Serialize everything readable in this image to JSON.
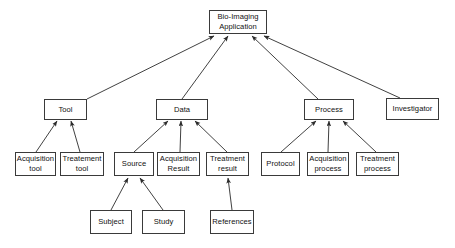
{
  "diagram": {
    "background_color": "#ffffff",
    "box_border_color": "#3a3a3a",
    "edge_color": "#2b2b2b",
    "text_color": "#111111",
    "nodes": [
      {
        "id": "app",
        "line1": "Bio-Imaging",
        "line2": "Application",
        "x": 209,
        "y": 10,
        "w": 58,
        "h": 24,
        "level": 0
      },
      {
        "id": "tool",
        "line1": "Tool",
        "line2": "",
        "x": 44,
        "y": 99,
        "w": 43,
        "h": 21,
        "level": 1
      },
      {
        "id": "data",
        "line1": "Data",
        "line2": "",
        "x": 156,
        "y": 99,
        "w": 52,
        "h": 21,
        "level": 1
      },
      {
        "id": "process",
        "line1": "Process",
        "line2": "",
        "x": 304,
        "y": 99,
        "w": 50,
        "h": 21,
        "level": 1
      },
      {
        "id": "investigator",
        "line1": "Investigator",
        "line2": "",
        "x": 386,
        "y": 98,
        "w": 53,
        "h": 22,
        "level": 1
      },
      {
        "id": "acquisition-tool",
        "line1": "Acquisition",
        "line2": "tool",
        "x": 15,
        "y": 152,
        "w": 41,
        "h": 24,
        "level": 2
      },
      {
        "id": "treatement-tool",
        "line1": "Treatement",
        "line2": "tool",
        "x": 60,
        "y": 152,
        "w": 44,
        "h": 24,
        "level": 2
      },
      {
        "id": "source",
        "line1": "Source",
        "line2": "",
        "x": 114,
        "y": 152,
        "w": 40,
        "h": 24,
        "level": 2
      },
      {
        "id": "acquisition-result",
        "line1": "Acquisition",
        "line2": "Result",
        "x": 157,
        "y": 152,
        "w": 43,
        "h": 24,
        "level": 2
      },
      {
        "id": "treatment-result",
        "line1": "Treatment",
        "line2": "result",
        "x": 206,
        "y": 152,
        "w": 43,
        "h": 24,
        "level": 2
      },
      {
        "id": "protocol",
        "line1": "Protocol",
        "line2": "",
        "x": 261,
        "y": 152,
        "w": 39,
        "h": 24,
        "level": 2
      },
      {
        "id": "acquisition-process",
        "line1": "Acquisition",
        "line2": "process",
        "x": 307,
        "y": 152,
        "w": 42,
        "h": 24,
        "level": 2
      },
      {
        "id": "treatment-process",
        "line1": "Treatment",
        "line2": "process",
        "x": 356,
        "y": 152,
        "w": 43,
        "h": 24,
        "level": 2
      },
      {
        "id": "subject",
        "line1": "Subject",
        "line2": "",
        "x": 90,
        "y": 210,
        "w": 42,
        "h": 24,
        "level": 3
      },
      {
        "id": "study",
        "line1": "Study",
        "line2": "",
        "x": 142,
        "y": 210,
        "w": 43,
        "h": 24,
        "level": 3
      },
      {
        "id": "references",
        "line1": "References",
        "line2": "",
        "x": 210,
        "y": 210,
        "w": 44,
        "h": 24,
        "level": 3
      }
    ],
    "edges": [
      {
        "from": "tool",
        "to": "app",
        "x1": 87,
        "y1": 99,
        "x2": 214,
        "y2": 36
      },
      {
        "from": "data",
        "to": "app",
        "x1": 182,
        "y1": 99,
        "x2": 228,
        "y2": 36
      },
      {
        "from": "process",
        "to": "app",
        "x1": 318,
        "y1": 99,
        "x2": 252,
        "y2": 36
      },
      {
        "from": "investigator",
        "to": "app",
        "x1": 400,
        "y1": 98,
        "x2": 264,
        "y2": 36
      },
      {
        "from": "acquisition-tool",
        "to": "tool",
        "x1": 36,
        "y1": 152,
        "x2": 57,
        "y2": 121
      },
      {
        "from": "treatement-tool",
        "to": "tool",
        "x1": 80,
        "y1": 152,
        "x2": 71,
        "y2": 121
      },
      {
        "from": "source",
        "to": "data",
        "x1": 134,
        "y1": 152,
        "x2": 168,
        "y2": 121
      },
      {
        "from": "acquisition-result",
        "to": "data",
        "x1": 180,
        "y1": 152,
        "x2": 181,
        "y2": 121
      },
      {
        "from": "treatment-result",
        "to": "data",
        "x1": 227,
        "y1": 152,
        "x2": 195,
        "y2": 121
      },
      {
        "from": "protocol",
        "to": "process",
        "x1": 281,
        "y1": 152,
        "x2": 316,
        "y2": 121
      },
      {
        "from": "acquisition-process",
        "to": "process",
        "x1": 328,
        "y1": 152,
        "x2": 329,
        "y2": 121
      },
      {
        "from": "treatment-process",
        "to": "process",
        "x1": 376,
        "y1": 152,
        "x2": 343,
        "y2": 121
      },
      {
        "from": "subject",
        "to": "source",
        "x1": 111,
        "y1": 210,
        "x2": 128,
        "y2": 178
      },
      {
        "from": "study",
        "to": "source",
        "x1": 163,
        "y1": 210,
        "x2": 140,
        "y2": 178
      },
      {
        "from": "references",
        "to": "treatment-result",
        "x1": 232,
        "y1": 210,
        "x2": 228,
        "y2": 178
      }
    ]
  }
}
